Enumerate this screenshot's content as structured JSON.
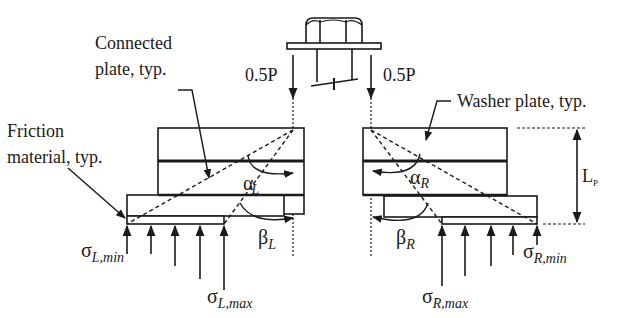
{
  "diagram": {
    "type": "bolted friction connection free-body diagram",
    "labels": {
      "connected_plate_line1": "Connected",
      "connected_plate_line2": "plate, typ.",
      "friction_line1": "Friction",
      "friction_line2": "material, typ.",
      "washer_plate": "Washer plate, typ.",
      "load_left": "0.5P",
      "load_right": "0.5P",
      "lp": "L",
      "lp_sub": "P",
      "alpha_L": "α",
      "alpha_L_sub": "L",
      "beta_L": "β",
      "beta_L_sub": "L",
      "alpha_R": "α",
      "alpha_R_sub": "R",
      "beta_R": "β",
      "beta_R_sub": "R",
      "sigma_L_min": "σ",
      "sigma_L_min_sub": "L,min",
      "sigma_L_max": "σ",
      "sigma_L_max_sub": "L,max",
      "sigma_R_min": "σ",
      "sigma_R_min_sub": "R,min",
      "sigma_R_max": "σ",
      "sigma_R_max_sub": "R,max"
    },
    "colors": {
      "stroke": "#1a1a1a",
      "background": "#ffffff"
    }
  }
}
